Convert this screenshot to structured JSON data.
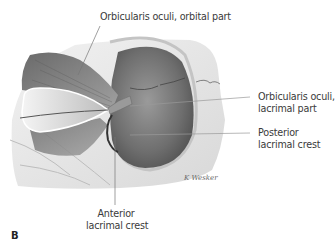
{
  "figure": {
    "panel_letter": "B",
    "illustration": "Orbit region dissection showing orbicularis oculi muscle with lacrimal sac exposed",
    "signature": "K. Wesker",
    "labels": [
      {
        "id": "orbital-part",
        "line1": "Orbicularis oculi, orbital part",
        "line2": ""
      },
      {
        "id": "lacrimal-part",
        "line1": "Orbicularis oculi,",
        "line2": "lacrimal part"
      },
      {
        "id": "posterior-crest",
        "line1": "Posterior",
        "line2": "lacrimal crest"
      },
      {
        "id": "anterior-crest",
        "line1": "Anterior",
        "line2": "lacrimal crest"
      }
    ]
  },
  "colors": {
    "muscle": "#8c8c8c",
    "bone": "#e6e6e6",
    "lacrimal_sac": "#7a7a7a",
    "leader_line": "#777777",
    "text": "#3a3a3a"
  }
}
